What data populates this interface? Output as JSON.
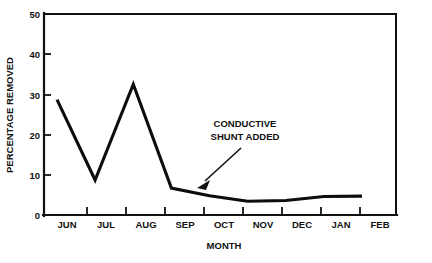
{
  "chart_data": {
    "type": "line",
    "title": "",
    "xlabel": "MONTH",
    "ylabel": "PERCENTAGE REMOVED",
    "categories": [
      "JUN",
      "JUL",
      "AUG",
      "SEP",
      "OCT",
      "NOV",
      "DEC",
      "JAN",
      "FEB"
    ],
    "values": [
      28.7,
      8.7,
      32.5,
      6.7,
      4.8,
      3.4,
      3.6,
      4.6,
      4.7
    ],
    "series": [
      {
        "name": "percentage removed",
        "values": [
          28.7,
          8.7,
          32.5,
          6.7,
          4.8,
          3.4,
          3.6,
          4.6,
          4.7
        ]
      }
    ],
    "ylim": [
      0,
      50
    ],
    "yticks": [
      0,
      10,
      20,
      30,
      40,
      50
    ],
    "ytick_labels": [
      "0",
      "10",
      "20",
      "30",
      "40",
      "50"
    ],
    "xtick_labels": [
      "JUN",
      "JUL",
      "AUG",
      "SEP",
      "OCT",
      "NOV",
      "DEC",
      "JAN",
      "FEB"
    ],
    "grid": false,
    "legend": "none",
    "line_color": "#0d0d0d",
    "axis_color": "#111111",
    "background_color": "#ffffff",
    "annotations": [
      {
        "id": "conductive-shunt",
        "line1": "CONDUCTIVE",
        "line2": "SHUNT ADDED",
        "points_to_category": "SEP",
        "points_to_value": 6.7
      }
    ]
  },
  "axes": {
    "y_title": "PERCENTAGE REMOVED",
    "x_title": "MONTH",
    "y_ticks": [
      "50",
      "40",
      "30",
      "20",
      "10",
      "0"
    ],
    "x_ticks": [
      "JUN",
      "JUL",
      "AUG",
      "SEP",
      "OCT",
      "NOV",
      "DEC",
      "JAN",
      "FEB"
    ]
  },
  "annotation": {
    "line1": "CONDUCTIVE",
    "line2": "SHUNT ADDED"
  }
}
